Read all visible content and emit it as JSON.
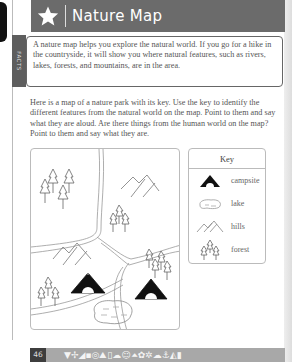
{
  "header": {
    "icon": "star-icon",
    "title": "Nature Map"
  },
  "facts": {
    "tab_label": "FACTS",
    "text": "A nature map helps you explore the natural world. If you go for a hike in the countryside, it will show you where natural features, such as rivers, lakes, forests, and mountains, are in the area."
  },
  "intro": {
    "text": "Here is a map of a nature park with its key. Use the key to identify the different features from the natural world on the map. Point to them and say what they are aloud. Are there things from the human world on the map? Point to them and say what they are."
  },
  "map": {
    "features": [
      "forest",
      "hills",
      "forest",
      "hills",
      "campsite",
      "forest",
      "forest",
      "campsite",
      "lake"
    ]
  },
  "key": {
    "title": "Key",
    "items": [
      {
        "icon": "campsite-icon",
        "label": "campsite"
      },
      {
        "icon": "lake-icon",
        "label": "lake"
      },
      {
        "icon": "hills-icon",
        "label": "hills"
      },
      {
        "icon": "forest-icon",
        "label": "forest"
      }
    ]
  },
  "footer": {
    "page_number": "46",
    "icon_strip": "▼✢◢▪◎⛰▯☁☺⏶✿✲☁⚓◭▮"
  },
  "colors": {
    "header_bg": "#6b6b6b",
    "footer_bg": "#a8a8a8",
    "page_num_bg": "#3d3d3d"
  }
}
